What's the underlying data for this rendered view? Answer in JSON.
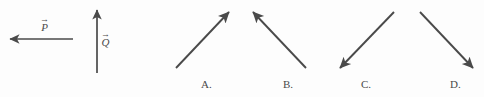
{
  "figure": {
    "width": 484,
    "height": 97,
    "background_color": "#fdfdfd",
    "stroke_color": "#4a4a4a",
    "text_color": "#4a4a4a"
  },
  "given_vectors": [
    {
      "id": "P",
      "glyph": "P",
      "accent": "→",
      "direction": "left",
      "label_x": 40,
      "label_y": 17,
      "tail_x": 73,
      "tail_y": 39,
      "tip_x": 10,
      "tip_y": 39
    },
    {
      "id": "Q",
      "glyph": "Q",
      "accent": "→",
      "direction": "up",
      "label_x": 101,
      "label_y": 32,
      "tail_x": 97,
      "tail_y": 73,
      "tip_x": 97,
      "tip_y": 10
    }
  ],
  "choices": [
    {
      "id": "A",
      "label": "A.",
      "direction": "up-right",
      "tail_x": 176,
      "tail_y": 68,
      "tip_x": 229,
      "tip_y": 12,
      "label_x": 201,
      "label_y": 79
    },
    {
      "id": "B",
      "label": "B.",
      "direction": "up-left",
      "tail_x": 306,
      "tail_y": 68,
      "tip_x": 253,
      "tip_y": 12,
      "label_x": 283,
      "label_y": 79
    },
    {
      "id": "C",
      "label": "C.",
      "direction": "down-left",
      "tail_x": 394,
      "tail_y": 12,
      "tip_x": 340,
      "tip_y": 68,
      "label_x": 361,
      "label_y": 79
    },
    {
      "id": "D",
      "label": "D.",
      "direction": "down-right",
      "tail_x": 420,
      "tail_y": 12,
      "tip_x": 473,
      "tip_y": 68,
      "label_x": 450,
      "label_y": 79
    }
  ]
}
